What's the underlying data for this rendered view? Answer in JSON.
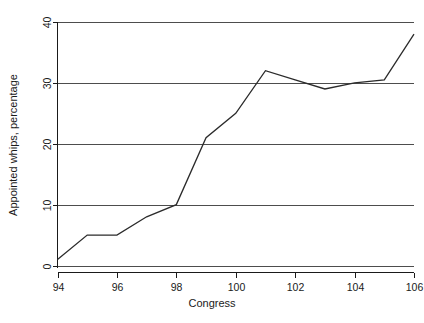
{
  "chart_data": {
    "type": "line",
    "title": "",
    "xlabel": "Congress",
    "ylabel": "Appointed whips, percentage",
    "x": [
      94,
      95,
      96,
      97,
      98,
      99,
      100,
      101,
      102,
      103,
      104,
      105,
      106
    ],
    "values": [
      1,
      5,
      5,
      8,
      10,
      21,
      25,
      32,
      30.5,
      29,
      30,
      30.5,
      38
    ],
    "series": [
      {
        "name": "Appointed whips, percentage",
        "values": [
          1,
          5,
          5,
          8,
          10,
          21,
          25,
          32,
          30.5,
          29,
          30,
          30.5,
          38
        ]
      }
    ],
    "xlim": [
      94,
      106
    ],
    "ylim": [
      0,
      40
    ],
    "xticks": [
      94,
      96,
      98,
      100,
      102,
      104,
      106
    ],
    "xtick_labels": [
      "94",
      "96",
      "98",
      "100",
      "102",
      "104",
      "106"
    ],
    "yticks": [
      0,
      10,
      20,
      30,
      40
    ],
    "ytick_labels": [
      "0",
      "10",
      "20",
      "30",
      "40"
    ],
    "grid": "horizontal",
    "legend": "none",
    "line_color": "#2b2b2b",
    "grid_color": "#4d4d4d",
    "background_color": "#ffffff"
  }
}
